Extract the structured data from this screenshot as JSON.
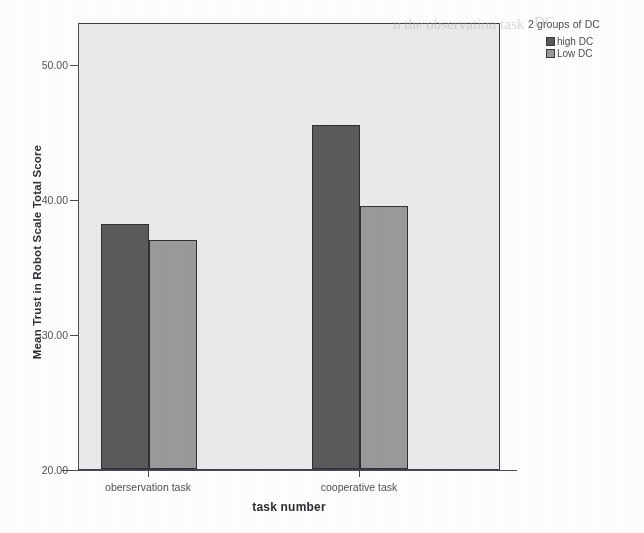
{
  "chart_data": {
    "type": "bar",
    "title": "",
    "xlabel": "task number",
    "ylabel": "Mean Trust in Robot Scale Total Score",
    "categories": [
      "oberservation task",
      "cooperative task"
    ],
    "series": [
      {
        "name": "high DC",
        "color": "#5b5b5b",
        "values": [
          38.2,
          45.5
        ]
      },
      {
        "name": "Low DC",
        "color": "#9a9a9a",
        "values": [
          37.0,
          39.5
        ]
      }
    ],
    "ylim": [
      20.0,
      53.0
    ],
    "yticks": [
      20.0,
      30.0,
      40.0,
      50.0
    ],
    "ytick_labels": [
      "20.00",
      "30.00",
      "40.00",
      "50.00"
    ],
    "grid": false,
    "legend_position": "right-top",
    "plot_background": "#ebebeb",
    "axis_color": "#4a4a55"
  },
  "legend": {
    "title": "2 groups of DC",
    "items": [
      {
        "label": "high DC",
        "swatch": "legend-swatch-high-dc"
      },
      {
        "label": "Low DC",
        "swatch": "legend-swatch-low-dc"
      }
    ]
  },
  "axes": {
    "y_title": "Mean Trust in Robot Scale Total Score",
    "x_title": "task number",
    "y_tick_labels": [
      "50.00",
      "40.00",
      "30.00",
      "20.00"
    ],
    "x_category_labels": [
      "oberservation task",
      "cooperative task"
    ]
  },
  "scan_bleed": {
    "line_1": "n the observation task",
    "line_2": "DC"
  }
}
